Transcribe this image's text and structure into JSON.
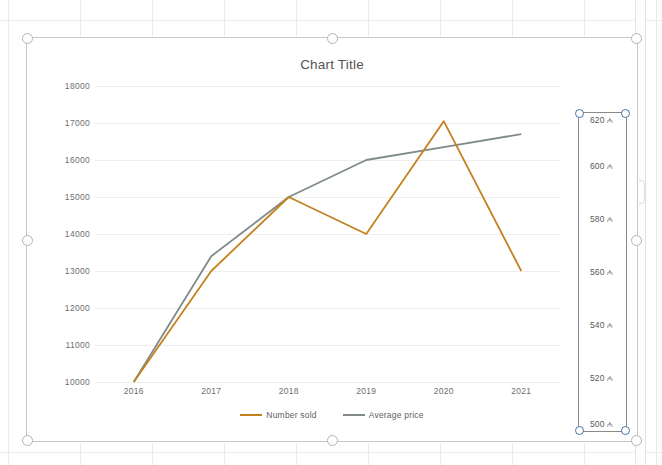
{
  "app": {
    "context": "excel-chart-selected",
    "chart_selected": true,
    "selected_element": "secondary-value-axis"
  },
  "chart_data": {
    "type": "line",
    "title": "Chart Title",
    "xlabel": "",
    "ylabel": "",
    "grid": true,
    "legend_position": "bottom",
    "categories": [
      "2016",
      "2017",
      "2018",
      "2019",
      "2020",
      "2021"
    ],
    "series": [
      {
        "name": "Number sold",
        "color": "#c5811f",
        "axis": "primary",
        "values": [
          10000,
          13000,
          15000,
          14000,
          17050,
          13000
        ]
      },
      {
        "name": "Average price",
        "color": "#808a8a",
        "axis": "secondary",
        "values": [
          10000,
          13400,
          15000,
          16000,
          16350,
          16700
        ]
      }
    ],
    "primary_axis": {
      "ticks": [
        "10000",
        "11000",
        "12000",
        "13000",
        "14000",
        "15000",
        "16000",
        "17000",
        "18000"
      ],
      "min": 10000,
      "max": 18000,
      "step": 1000
    },
    "secondary_axis": {
      "ticks": [
        "620",
        "600",
        "580",
        "560",
        "540",
        "520",
        "500"
      ],
      "currency_symbol": "₼",
      "min": 500,
      "max": 620,
      "step": 20,
      "selected": true
    }
  },
  "legend": {
    "items": [
      {
        "label": "Number sold",
        "color": "#c5811f"
      },
      {
        "label": "Average price",
        "color": "#808a8a"
      }
    ]
  },
  "colors": {
    "series_orange": "#c5811f",
    "series_gray": "#808a8a",
    "gridline": "#eeeeee",
    "axis_text": "#6e6e6e",
    "selection_blue": "#4472a8",
    "chart_border": "#c8c8c8"
  }
}
